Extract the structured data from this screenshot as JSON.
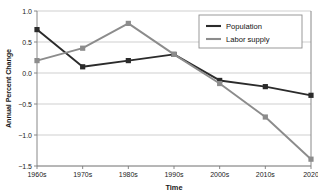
{
  "chart_data": {
    "type": "line",
    "title": "",
    "xlabel": "Time",
    "ylabel": "Annual Percent Change",
    "categories": [
      "1960s",
      "1970s",
      "1980s",
      "1990s",
      "2000s",
      "2010s",
      "2020"
    ],
    "ylim": [
      -1.5,
      1.0
    ],
    "ytick_labels": [
      "1.0",
      "0.5",
      "0.0",
      "-0.5",
      "-1.0",
      "-1.5"
    ],
    "ytick_values": [
      1.0,
      0.5,
      0.0,
      -0.5,
      -1.0,
      -1.5
    ],
    "grid": "horizontal",
    "legend_position": "top-right",
    "series": [
      {
        "name": "Population",
        "color": "#2b2b2b",
        "marker": "square",
        "values": [
          0.7,
          0.1,
          0.2,
          0.3,
          -0.12,
          -0.22,
          -0.36
        ]
      },
      {
        "name": "Labor supply",
        "color": "#8c8c8c",
        "marker": "square",
        "values": [
          0.2,
          0.4,
          0.8,
          0.3,
          -0.17,
          -0.71,
          -1.39
        ]
      }
    ]
  },
  "colors": {
    "population": "#2b2b2b",
    "labor_supply": "#8c8c8c",
    "grid": "#c9c9c9",
    "axis": "#7a7a7a",
    "legend_border": "#8f8f8f",
    "background": "#ffffff"
  }
}
